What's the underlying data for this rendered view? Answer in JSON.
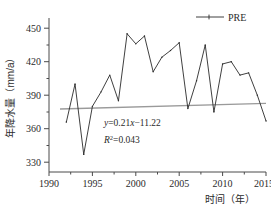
{
  "chart_data": {
    "type": "line",
    "title": "",
    "xlabel": "时间（年）",
    "ylabel": "年降水量（mm/a）",
    "xlim": [
      1990,
      2015
    ],
    "ylim": [
      322,
      458
    ],
    "xticks": [
      1990,
      1995,
      2000,
      2005,
      2010,
      2015
    ],
    "yticks": [
      330,
      360,
      390,
      420,
      450
    ],
    "grid": false,
    "legend_position": "top-right",
    "x": [
      1992,
      1993,
      1994,
      1995,
      1996,
      1997,
      1998,
      1999,
      2000,
      2001,
      2002,
      2003,
      2004,
      2005,
      2006,
      2007,
      2008,
      2009,
      2010,
      2011,
      2012,
      2013,
      2014,
      2015
    ],
    "series": [
      {
        "name": "PRE",
        "color": "#2a2a2a",
        "values": [
          366,
          400,
          337,
          380,
          393,
          408,
          385,
          445,
          436,
          443,
          411,
          424,
          430,
          437,
          378,
          403,
          435,
          375,
          418,
          420,
          408,
          410,
          390,
          367
        ]
      },
      {
        "name": "trend",
        "color": "#9a9a9a",
        "slope": 0.21,
        "intercept": -11.22,
        "y_start": 403,
        "y_end": 408
      }
    ],
    "annotations": [
      {
        "id": "equation",
        "text": "y=0.21x−11.22"
      },
      {
        "id": "r-squared",
        "text": "R2=0.043",
        "r2_value": "0.043"
      }
    ]
  },
  "legend": {
    "entries": [
      {
        "label": "PRE"
      }
    ]
  },
  "axes": {
    "y_title": "年降水量（mm/a）",
    "x_title": "时间（年）",
    "x_tick_labels": [
      "1990",
      "1995",
      "2000",
      "2005",
      "2010",
      "2015"
    ],
    "y_tick_labels": [
      "450",
      "420",
      "390",
      "360",
      "330"
    ]
  },
  "equation": {
    "y_symbol": "y",
    "eq_body": "=0.21",
    "x_symbol": "x",
    "eq_tail": "−11.22",
    "r_symbol": "R",
    "r_exp": "2",
    "r_value": "=0.043"
  }
}
